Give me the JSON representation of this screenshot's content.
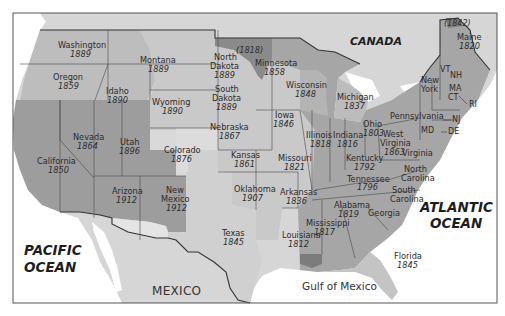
{
  "map": {
    "colors": {
      "water": "#ffffff",
      "foreign_land": "#d6d6d6",
      "original_states": "#a6a6a6",
      "louisiana_purchase": "#c9c9c9",
      "northwest_territories": "#b8b8b8",
      "texas_annex": "#d0d0d0",
      "mexican_cession": "#9d9d9d",
      "oregon": "#bdbdbd",
      "gadsden": "#e4e4e4",
      "red_river_1818": "#8a8a8a",
      "florida": "#c4c4c4",
      "west_florida": "#7c7c7c",
      "border": "#333333",
      "frame": "#555555"
    },
    "regions": {
      "canada": "CANADA",
      "mexico": "MEXICO",
      "pacific": [
        "PACIFIC",
        "OCEAN"
      ],
      "atlantic": [
        "ATLANTIC",
        "OCEAN"
      ],
      "gulf": "Gulf of Mexico"
    },
    "annotations": {
      "red_river": "(1818)",
      "maine_north": "(1842)"
    },
    "states": [
      {
        "name": "Washington",
        "year": "1889"
      },
      {
        "name": "Oregon",
        "year": "1859"
      },
      {
        "name": "Idaho",
        "year": "1890"
      },
      {
        "name": "Montana",
        "year": "1889"
      },
      {
        "name": "Wyoming",
        "year": "1890"
      },
      {
        "name": "North Dakota",
        "lines": [
          "North",
          "Dakota"
        ],
        "year": "1889"
      },
      {
        "name": "South Dakota",
        "lines": [
          "South",
          "Dakota"
        ],
        "year": "1889"
      },
      {
        "name": "Minnesota",
        "year": "1858"
      },
      {
        "name": "Wisconsin",
        "year": "1848"
      },
      {
        "name": "Michigan",
        "year": "1837"
      },
      {
        "name": "Nevada",
        "year": "1864"
      },
      {
        "name": "Utah",
        "year": "1896"
      },
      {
        "name": "Colorado",
        "year": "1876"
      },
      {
        "name": "Nebraska",
        "year": "1867"
      },
      {
        "name": "Iowa",
        "year": "1846"
      },
      {
        "name": "Illinois",
        "year": "1818"
      },
      {
        "name": "Indiana",
        "year": "1816"
      },
      {
        "name": "Ohio",
        "year": "1803"
      },
      {
        "name": "California",
        "year": "1850"
      },
      {
        "name": "Kansas",
        "year": "1861"
      },
      {
        "name": "Missouri",
        "year": "1821"
      },
      {
        "name": "Kentucky",
        "year": "1792"
      },
      {
        "name": "West Virginia",
        "lines": [
          "West",
          "Virginia"
        ],
        "year": "1863"
      },
      {
        "name": "Arizona",
        "year": "1912"
      },
      {
        "name": "New Mexico",
        "lines": [
          "New",
          "Mexico"
        ],
        "year": "1912"
      },
      {
        "name": "Oklahoma",
        "year": "1907"
      },
      {
        "name": "Arkansas",
        "year": "1836"
      },
      {
        "name": "Tennessee",
        "year": "1796"
      },
      {
        "name": "Texas",
        "year": "1845"
      },
      {
        "name": "Louisiana",
        "year": "1812"
      },
      {
        "name": "Mississippi",
        "year": "1817"
      },
      {
        "name": "Alabama",
        "year": "1819"
      },
      {
        "name": "Georgia",
        "year": ""
      },
      {
        "name": "Florida",
        "year": "1845"
      },
      {
        "name": "South Carolina",
        "lines": [
          "South",
          "Carolina"
        ],
        "year": ""
      },
      {
        "name": "North Carolina",
        "lines": [
          "North",
          "Carolina"
        ],
        "year": ""
      },
      {
        "name": "Virginia",
        "year": ""
      },
      {
        "name": "Pennsylvania",
        "year": ""
      },
      {
        "name": "New York",
        "lines": [
          "New",
          "York"
        ],
        "year": ""
      },
      {
        "name": "Maine",
        "year": "1820"
      }
    ],
    "abbrev": [
      "VT",
      "NH",
      "MA",
      "CT",
      "RI",
      "NJ",
      "DE",
      "MD"
    ]
  }
}
